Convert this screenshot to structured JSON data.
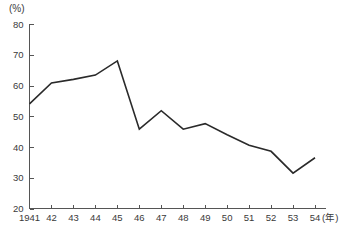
{
  "chart_data": {
    "type": "line",
    "title": "",
    "subtitle": "",
    "xlabel": "(年)",
    "ylabel": "(%)",
    "unit_label": "(%)",
    "xlim": [
      1941,
      1954
    ],
    "ylim": [
      20,
      80
    ],
    "y_ticks": [
      80,
      70,
      60,
      50,
      40,
      30,
      20
    ],
    "y_tick_labels": [
      "80",
      "70",
      "60",
      "50",
      "40",
      "30",
      "20"
    ],
    "x_ticks": [
      1941,
      1942,
      1943,
      1944,
      1945,
      1946,
      1947,
      1948,
      1949,
      1950,
      1951,
      1952,
      1953,
      1954
    ],
    "x_tick_labels": [
      "1941",
      "42",
      "43",
      "44",
      "45",
      "46",
      "47",
      "48",
      "49",
      "50",
      "51",
      "52",
      "53",
      "54"
    ],
    "x_axis_unit": "(年)",
    "grid": false,
    "legend": false,
    "legend_position": "none",
    "categories": [
      "1941",
      "42",
      "43",
      "44",
      "45",
      "46",
      "47",
      "48",
      "49",
      "50",
      "51",
      "52",
      "53",
      "54"
    ],
    "values": [
      54.0,
      60.8,
      62.0,
      63.4,
      68.0,
      45.8,
      51.8,
      45.8,
      47.6,
      44.0,
      40.6,
      38.6,
      31.5,
      36.5
    ],
    "series": [
      {
        "name": "",
        "color": "#2a2a2a",
        "values": [
          54.0,
          60.8,
          62.0,
          63.4,
          68.0,
          45.8,
          51.8,
          45.8,
          47.6,
          44.0,
          40.6,
          38.6,
          31.5,
          36.5
        ]
      }
    ],
    "annotations": []
  },
  "colors": {
    "line": "#2a2a2a",
    "axis": "#555555",
    "text": "#3a3a3a",
    "background": "#ffffff"
  }
}
